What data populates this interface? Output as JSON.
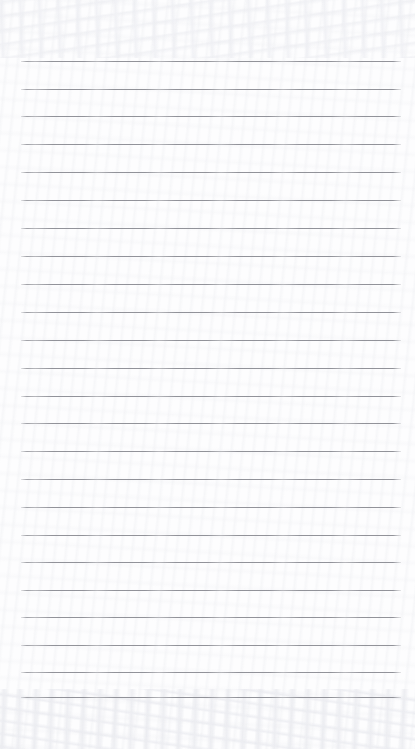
{
  "document": {
    "kind": "scanned-ruled-paper",
    "title": "Lined Paper Scan",
    "page_width": 415,
    "page_height": 749,
    "background_color": "#fdfdfe",
    "has_text_content": false,
    "has_handwriting": false,
    "has_header": false,
    "has_margin_rule": false,
    "visible_text": ""
  },
  "ruling": {
    "line_color": "#8c8d94",
    "line_thickness_px": 1,
    "line_count": 24,
    "first_line_y": 61,
    "line_spacing_px": 27.7,
    "left_edge_x": 21,
    "right_edge_x": 401,
    "top_margin_px": 61,
    "bottom_margin_px": 51,
    "lines": [
      {
        "index": 1,
        "y": 61,
        "x1": 21,
        "x2": 401
      },
      {
        "index": 2,
        "y": 89,
        "x1": 21,
        "x2": 401
      },
      {
        "index": 3,
        "y": 116,
        "x1": 21,
        "x2": 401
      },
      {
        "index": 4,
        "y": 144,
        "x1": 21,
        "x2": 401
      },
      {
        "index": 5,
        "y": 172,
        "x1": 21,
        "x2": 401
      },
      {
        "index": 6,
        "y": 200,
        "x1": 21,
        "x2": 401
      },
      {
        "index": 7,
        "y": 228,
        "x1": 21,
        "x2": 401
      },
      {
        "index": 8,
        "y": 256,
        "x1": 21,
        "x2": 401
      },
      {
        "index": 9,
        "y": 284,
        "x1": 21,
        "x2": 401
      },
      {
        "index": 10,
        "y": 312,
        "x1": 21,
        "x2": 401
      },
      {
        "index": 11,
        "y": 340,
        "x1": 21,
        "x2": 401
      },
      {
        "index": 12,
        "y": 368,
        "x1": 21,
        "x2": 401
      },
      {
        "index": 13,
        "y": 396,
        "x1": 21,
        "x2": 401
      },
      {
        "index": 14,
        "y": 423,
        "x1": 21,
        "x2": 401
      },
      {
        "index": 15,
        "y": 451,
        "x1": 21,
        "x2": 401
      },
      {
        "index": 16,
        "y": 479,
        "x1": 21,
        "x2": 401
      },
      {
        "index": 17,
        "y": 507,
        "x1": 21,
        "x2": 401
      },
      {
        "index": 18,
        "y": 535,
        "x1": 21,
        "x2": 401
      },
      {
        "index": 19,
        "y": 562,
        "x1": 21,
        "x2": 401
      },
      {
        "index": 20,
        "y": 590,
        "x1": 21,
        "x2": 401
      },
      {
        "index": 21,
        "y": 617,
        "x1": 21,
        "x2": 401
      },
      {
        "index": 22,
        "y": 645,
        "x1": 21,
        "x2": 401
      },
      {
        "index": 23,
        "y": 672,
        "x1": 21,
        "x2": 401
      },
      {
        "index": 24,
        "y": 697,
        "x1": 21,
        "x2": 401
      }
    ]
  }
}
